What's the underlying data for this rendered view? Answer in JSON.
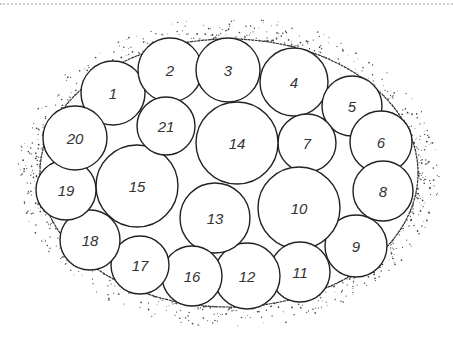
{
  "diagram": {
    "title": "",
    "outline": {
      "cx": 229,
      "cy": 173,
      "rx": 189,
      "ry": 134,
      "stroke": "#333333"
    },
    "circles": [
      {
        "label": "1",
        "cx": 113,
        "cy": 93,
        "r": 32
      },
      {
        "label": "2",
        "cx": 170,
        "cy": 70,
        "r": 32
      },
      {
        "label": "3",
        "cx": 228,
        "cy": 70,
        "r": 32
      },
      {
        "label": "4",
        "cx": 294,
        "cy": 82,
        "r": 34
      },
      {
        "label": "5",
        "cx": 352,
        "cy": 106,
        "r": 30
      },
      {
        "label": "6",
        "cx": 381,
        "cy": 142,
        "r": 31
      },
      {
        "label": "7",
        "cx": 307,
        "cy": 143,
        "r": 29
      },
      {
        "label": "8",
        "cx": 383,
        "cy": 191,
        "r": 30
      },
      {
        "label": "9",
        "cx": 356,
        "cy": 246,
        "r": 31
      },
      {
        "label": "10",
        "cx": 299,
        "cy": 208,
        "r": 41
      },
      {
        "label": "11",
        "cx": 300,
        "cy": 272,
        "r": 30
      },
      {
        "label": "12",
        "cx": 247,
        "cy": 276,
        "r": 33
      },
      {
        "label": "13",
        "cx": 215,
        "cy": 218,
        "r": 35
      },
      {
        "label": "14",
        "cx": 237,
        "cy": 143,
        "r": 41
      },
      {
        "label": "15",
        "cx": 137,
        "cy": 186,
        "r": 41
      },
      {
        "label": "16",
        "cx": 192,
        "cy": 276,
        "r": 30
      },
      {
        "label": "17",
        "cx": 140,
        "cy": 265,
        "r": 29
      },
      {
        "label": "18",
        "cx": 90,
        "cy": 240,
        "r": 30
      },
      {
        "label": "19",
        "cx": 66,
        "cy": 190,
        "r": 30
      },
      {
        "label": "20",
        "cx": 75,
        "cy": 138,
        "r": 32
      },
      {
        "label": "21",
        "cx": 166,
        "cy": 126,
        "r": 29
      }
    ]
  }
}
